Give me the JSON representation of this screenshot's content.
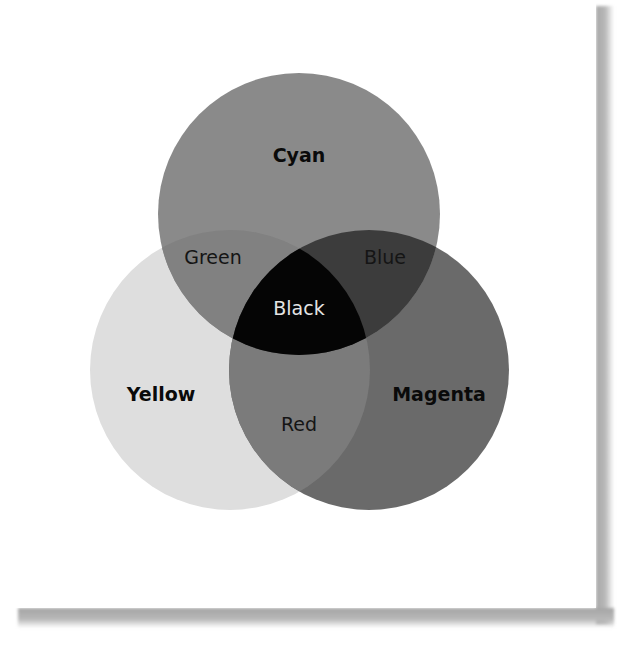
{
  "diagram": {
    "type": "venn",
    "title": "",
    "sets": [
      {
        "id": "cyan",
        "label": "Cyan",
        "color": "#8a8a8a",
        "center": [
          299,
          214
        ],
        "radius": 141
      },
      {
        "id": "yellow",
        "label": "Yellow",
        "color": "#dedede",
        "center": [
          230,
          370
        ],
        "radius": 140
      },
      {
        "id": "magenta",
        "label": "Magenta",
        "color": "#6a6a6a",
        "center": [
          369,
          370
        ],
        "radius": 140
      }
    ],
    "intersections": [
      {
        "sets": [
          "cyan",
          "yellow"
        ],
        "label": "Green",
        "color": "#818181"
      },
      {
        "sets": [
          "cyan",
          "magenta"
        ],
        "label": "Blue",
        "color": "#3c3c3c"
      },
      {
        "sets": [
          "yellow",
          "magenta"
        ],
        "label": "Red",
        "color": "#7b7b7b"
      },
      {
        "sets": [
          "cyan",
          "yellow",
          "magenta"
        ],
        "label": "Black",
        "color": "#050505"
      }
    ]
  },
  "labels": {
    "cyan": "Cyan",
    "yellow": "Yellow",
    "magenta": "Magenta",
    "green": "Green",
    "blue": "Blue",
    "red": "Red",
    "black": "Black"
  },
  "colors": {
    "cyan": "#8a8a8a",
    "yellow": "#dedede",
    "magenta": "#6a6a6a",
    "green": "#818181",
    "blue": "#3c3c3c",
    "red": "#7b7b7b",
    "black": "#050505",
    "page": "#ffffff",
    "shadow": "#a8a8a8"
  }
}
